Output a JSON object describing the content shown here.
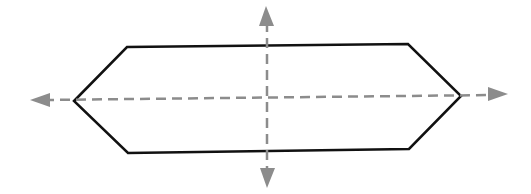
{
  "diagram": {
    "type": "elongated-hexagon-with-symmetry-axes",
    "colors": {
      "background": "#ffffff",
      "shape_stroke": "#111111",
      "axis_stroke": "#8c8c8c"
    },
    "hexagon": {
      "points": [
        [
          74,
          101
        ],
        [
          127,
          47
        ],
        [
          408,
          44
        ],
        [
          461,
          96
        ],
        [
          409,
          149
        ],
        [
          128,
          153
        ]
      ],
      "stroke_width": 2.5
    },
    "axes": {
      "horizontal": {
        "x1": 44,
        "y1": 100,
        "x2": 494,
        "y2": 95,
        "arrow_left": [
          [
            30,
            100
          ],
          [
            50,
            93
          ],
          [
            50,
            107
          ]
        ],
        "arrow_right": [
          [
            508,
            94
          ],
          [
            488,
            87
          ],
          [
            488,
            101
          ]
        ],
        "dash": "10 6"
      },
      "vertical": {
        "x1": 267,
        "y1": 22,
        "x2": 267,
        "y2": 172,
        "arrow_top": [
          [
            266,
            6
          ],
          [
            259,
            26
          ],
          [
            274,
            26
          ]
        ],
        "arrow_bottom": [
          [
            267,
            188
          ],
          [
            260,
            168
          ],
          [
            275,
            168
          ]
        ],
        "dash": "10 6"
      }
    }
  }
}
